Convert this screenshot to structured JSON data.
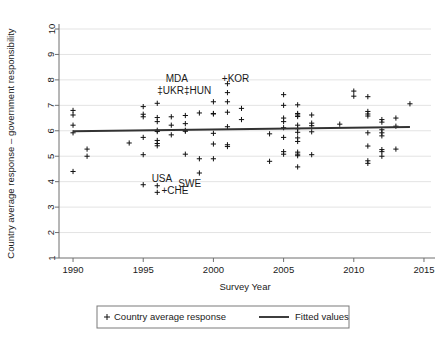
{
  "chart_data": {
    "type": "scatter",
    "title": "",
    "xlabel": "Survey Year",
    "ylabel": "Country average response – government responsibility",
    "xlim": [
      1989.0,
      2015.5
    ],
    "ylim": [
      1,
      10
    ],
    "xticks": [
      1990,
      1995,
      2000,
      2005,
      2010,
      2015
    ],
    "yticks": [
      1,
      2,
      3,
      4,
      5,
      6,
      7,
      8,
      9,
      10
    ],
    "grid": "horizontal",
    "legend_position": "below-axes",
    "legend": [
      {
        "key": "scatter",
        "marker": "+",
        "label": "Country average response"
      },
      {
        "key": "fit",
        "marker": "line",
        "label": "Fitted values"
      }
    ],
    "series": [
      {
        "name": "Country average response",
        "marker": "plus",
        "color": "#111111",
        "points": [
          [
            1990,
            6.8
          ],
          [
            1990,
            6.62
          ],
          [
            1990,
            6.22
          ],
          [
            1990,
            5.92
          ],
          [
            1990,
            4.4
          ],
          [
            1991,
            5.28
          ],
          [
            1991,
            5.0
          ],
          [
            1994,
            5.52
          ],
          [
            1995,
            6.95
          ],
          [
            1995,
            6.65
          ],
          [
            1995,
            6.55
          ],
          [
            1995,
            5.74
          ],
          [
            1995,
            5.06
          ],
          [
            1995,
            3.88
          ],
          [
            1996,
            7.08
          ],
          [
            1996,
            6.52
          ],
          [
            1996,
            6.36
          ],
          [
            1996,
            6.02
          ],
          [
            1996,
            5.97
          ],
          [
            1996,
            5.62
          ],
          [
            1996,
            5.5
          ],
          [
            1996,
            5.41
          ],
          [
            1996,
            3.84
          ],
          [
            1996,
            3.58
          ],
          [
            1997,
            6.55
          ],
          [
            1997,
            6.22
          ],
          [
            1997,
            5.84
          ],
          [
            1998,
            6.6
          ],
          [
            1998,
            6.28
          ],
          [
            1998,
            6.02
          ],
          [
            1998,
            5.98
          ],
          [
            1998,
            5.08
          ],
          [
            1999,
            6.7
          ],
          [
            1999,
            4.9
          ],
          [
            1999,
            4.34
          ],
          [
            2000,
            7.14
          ],
          [
            2000,
            6.68
          ],
          [
            2000,
            6.66
          ],
          [
            2000,
            5.9
          ],
          [
            2000,
            5.48
          ],
          [
            2000,
            4.9
          ],
          [
            2001,
            7.85
          ],
          [
            2001,
            7.5
          ],
          [
            2001,
            7.14
          ],
          [
            2001,
            6.73
          ],
          [
            2001,
            6.16
          ],
          [
            2001,
            5.45
          ],
          [
            2001,
            5.38
          ],
          [
            2002,
            6.88
          ],
          [
            2002,
            6.44
          ],
          [
            2004,
            5.88
          ],
          [
            2004,
            4.8
          ],
          [
            2005,
            7.42
          ],
          [
            2005,
            7.0
          ],
          [
            2005,
            6.5
          ],
          [
            2005,
            6.36
          ],
          [
            2005,
            6.12
          ],
          [
            2005,
            5.74
          ],
          [
            2005,
            5.18
          ],
          [
            2005,
            5.08
          ],
          [
            2006,
            7.02
          ],
          [
            2006,
            6.68
          ],
          [
            2006,
            6.62
          ],
          [
            2006,
            6.56
          ],
          [
            2006,
            6.22
          ],
          [
            2006,
            6.08
          ],
          [
            2006,
            5.94
          ],
          [
            2006,
            5.72
          ],
          [
            2006,
            5.58
          ],
          [
            2006,
            5.16
          ],
          [
            2006,
            5.08
          ],
          [
            2006,
            5.02
          ],
          [
            2006,
            4.58
          ],
          [
            2007,
            6.62
          ],
          [
            2007,
            6.3
          ],
          [
            2007,
            6.2
          ],
          [
            2007,
            5.96
          ],
          [
            2007,
            5.06
          ],
          [
            2009,
            6.26
          ],
          [
            2010,
            7.56
          ],
          [
            2010,
            7.36
          ],
          [
            2011,
            7.34
          ],
          [
            2011,
            6.76
          ],
          [
            2011,
            6.66
          ],
          [
            2011,
            6.58
          ],
          [
            2011,
            5.92
          ],
          [
            2011,
            5.4
          ],
          [
            2011,
            4.82
          ],
          [
            2011,
            4.72
          ],
          [
            2012,
            6.44
          ],
          [
            2012,
            6.34
          ],
          [
            2012,
            6.04
          ],
          [
            2012,
            5.92
          ],
          [
            2012,
            5.8
          ],
          [
            2012,
            5.26
          ],
          [
            2012,
            5.18
          ],
          [
            2012,
            5.0
          ],
          [
            2013,
            6.5
          ],
          [
            2013,
            6.18
          ],
          [
            2013,
            5.28
          ],
          [
            2014,
            7.06
          ]
        ]
      },
      {
        "name": "Fitted values",
        "type": "line",
        "color": "#333333",
        "x": [
          1990,
          2014
        ],
        "y": [
          5.98,
          6.15
        ]
      }
    ],
    "annotations": [
      {
        "text": "MDA",
        "x": 1996.6,
        "y": 7.9,
        "anchor": "start"
      },
      {
        "text": "‡UKR‡HUN",
        "x": 1996.0,
        "y": 7.45,
        "anchor": "start"
      },
      {
        "text": "+KOR",
        "x": 2000.6,
        "y": 7.9,
        "anchor": "start"
      },
      {
        "text": "USA",
        "x": 1995.6,
        "y": 3.98,
        "anchor": "start"
      },
      {
        "text": "SWE",
        "x": 1997.5,
        "y": 3.8,
        "anchor": "start"
      },
      {
        "text": "+CHE",
        "x": 1996.3,
        "y": 3.5,
        "anchor": "start"
      }
    ]
  }
}
